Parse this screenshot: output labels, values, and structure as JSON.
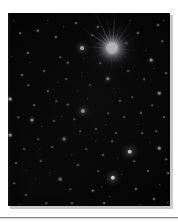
{
  "page": {
    "background_color": "#ffffff",
    "divider_color": "#8a8a8a"
  },
  "figure": {
    "name": "star-field-plate",
    "alt_text": "Dark astronomical star field photograph with one dominant bright star showing diffraction spikes",
    "plate_color": "#030303",
    "star_color": "#ffffff",
    "bounds": {
      "x": 8,
      "y": 13,
      "width": 162,
      "height": 193
    }
  },
  "chart_data": {
    "type": "scatter",
    "title": "",
    "xlabel": "",
    "ylabel": "",
    "xlim": [
      0,
      162
    ],
    "ylim": [
      0,
      193
    ],
    "grid": false,
    "legend": false,
    "primary_star": {
      "label": "dominant bright star",
      "x": 104,
      "y": 35,
      "magnitude": 1.0,
      "spikes": 24,
      "spike_length": 44
    },
    "series": [
      {
        "name": "field stars",
        "points": [
          {
            "x": 104,
            "y": 35,
            "m": 1.0
          },
          {
            "x": 74,
            "y": 35,
            "m": 0.48
          },
          {
            "x": 75,
            "y": 98,
            "m": 0.52
          },
          {
            "x": 122,
            "y": 139,
            "m": 0.58
          },
          {
            "x": 105,
            "y": 165,
            "m": 0.55
          },
          {
            "x": 100,
            "y": 66,
            "m": 0.4
          },
          {
            "x": 143,
            "y": 47,
            "m": 0.3
          },
          {
            "x": 24,
            "y": 107,
            "m": 0.34
          },
          {
            "x": 2,
            "y": 86,
            "m": 0.3
          },
          {
            "x": 2,
            "y": 122,
            "m": 0.28
          },
          {
            "x": 151,
            "y": 80,
            "m": 0.26
          },
          {
            "x": 56,
            "y": 126,
            "m": 0.3
          },
          {
            "x": 151,
            "y": 135,
            "m": 0.26
          },
          {
            "x": 52,
            "y": 166,
            "m": 0.28
          },
          {
            "x": 85,
            "y": 178,
            "m": 0.24
          },
          {
            "x": 30,
            "y": 18,
            "m": 0.22
          },
          {
            "x": 48,
            "y": 24,
            "m": 0.2
          },
          {
            "x": 20,
            "y": 40,
            "m": 0.2
          },
          {
            "x": 60,
            "y": 50,
            "m": 0.22
          },
          {
            "x": 90,
            "y": 14,
            "m": 0.18
          },
          {
            "x": 130,
            "y": 20,
            "m": 0.18
          },
          {
            "x": 150,
            "y": 12,
            "m": 0.17
          },
          {
            "x": 112,
            "y": 88,
            "m": 0.2
          },
          {
            "x": 133,
            "y": 100,
            "m": 0.19
          },
          {
            "x": 60,
            "y": 92,
            "m": 0.22
          },
          {
            "x": 40,
            "y": 78,
            "m": 0.18
          },
          {
            "x": 14,
            "y": 62,
            "m": 0.17
          },
          {
            "x": 33,
            "y": 148,
            "m": 0.2
          },
          {
            "x": 70,
            "y": 152,
            "m": 0.19
          },
          {
            "x": 95,
            "y": 142,
            "m": 0.18
          },
          {
            "x": 128,
            "y": 176,
            "m": 0.18
          },
          {
            "x": 146,
            "y": 186,
            "m": 0.17
          },
          {
            "x": 18,
            "y": 182,
            "m": 0.17
          },
          {
            "x": 64,
            "y": 190,
            "m": 0.16
          },
          {
            "x": 108,
            "y": 120,
            "m": 0.17
          },
          {
            "x": 88,
            "y": 116,
            "m": 0.16
          },
          {
            "x": 46,
            "y": 108,
            "m": 0.16
          },
          {
            "x": 156,
            "y": 104,
            "m": 0.15
          },
          {
            "x": 120,
            "y": 58,
            "m": 0.15
          },
          {
            "x": 82,
            "y": 72,
            "m": 0.15
          },
          {
            "x": 26,
            "y": 92,
            "m": 0.14
          },
          {
            "x": 140,
            "y": 158,
            "m": 0.15
          },
          {
            "x": 96,
            "y": 190,
            "m": 0.14
          },
          {
            "x": 8,
            "y": 150,
            "m": 0.14
          },
          {
            "x": 58,
            "y": 66,
            "m": 0.14
          },
          {
            "x": 116,
            "y": 104,
            "m": 0.13
          },
          {
            "x": 36,
            "y": 58,
            "m": 0.13
          },
          {
            "x": 68,
            "y": 10,
            "m": 0.13
          },
          {
            "x": 158,
            "y": 60,
            "m": 0.13
          },
          {
            "x": 12,
            "y": 20,
            "m": 0.12
          },
          {
            "x": 44,
            "y": 134,
            "m": 0.13
          },
          {
            "x": 78,
            "y": 136,
            "m": 0.12
          },
          {
            "x": 100,
            "y": 100,
            "m": 0.12
          },
          {
            "x": 134,
            "y": 120,
            "m": 0.12
          },
          {
            "x": 160,
            "y": 160,
            "m": 0.12
          },
          {
            "x": 6,
            "y": 170,
            "m": 0.12
          },
          {
            "x": 92,
            "y": 50,
            "m": 0.12
          },
          {
            "x": 52,
            "y": 44,
            "m": 0.11
          },
          {
            "x": 124,
            "y": 84,
            "m": 0.11
          },
          {
            "x": 72,
            "y": 118,
            "m": 0.11
          },
          {
            "x": 30,
            "y": 126,
            "m": 0.11
          },
          {
            "x": 148,
            "y": 118,
            "m": 0.11
          },
          {
            "x": 112,
            "y": 196,
            "m": 0.11
          },
          {
            "x": 38,
            "y": 190,
            "m": 0.1
          },
          {
            "x": 154,
            "y": 28,
            "m": 0.1
          },
          {
            "x": 84,
            "y": 22,
            "m": 0.1
          },
          {
            "x": 16,
            "y": 136,
            "m": 0.1
          },
          {
            "x": 62,
            "y": 176,
            "m": 0.1
          },
          {
            "x": 136,
            "y": 66,
            "m": 0.1
          },
          {
            "x": 104,
            "y": 128,
            "m": 0.1
          },
          {
            "x": 20,
            "y": 72,
            "m": 0.09
          },
          {
            "x": 144,
            "y": 92,
            "m": 0.09
          },
          {
            "x": 66,
            "y": 106,
            "m": 0.09
          },
          {
            "x": 118,
            "y": 30,
            "m": 0.09
          },
          {
            "x": 90,
            "y": 158,
            "m": 0.09
          },
          {
            "x": 48,
            "y": 88,
            "m": 0.09
          },
          {
            "x": 158,
            "y": 146,
            "m": 0.09
          },
          {
            "x": 10,
            "y": 104,
            "m": 0.09
          },
          {
            "x": 126,
            "y": 148,
            "m": 0.09
          },
          {
            "x": 74,
            "y": 60,
            "m": 0.08
          },
          {
            "x": 42,
            "y": 160,
            "m": 0.08
          },
          {
            "x": 106,
            "y": 76,
            "m": 0.08
          },
          {
            "x": 152,
            "y": 172,
            "m": 0.08
          },
          {
            "x": 28,
            "y": 166,
            "m": 0.08
          },
          {
            "x": 80,
            "y": 86,
            "m": 0.08
          },
          {
            "x": 138,
            "y": 38,
            "m": 0.08
          },
          {
            "x": 56,
            "y": 14,
            "m": 0.08
          },
          {
            "x": 98,
            "y": 112,
            "m": 0.08
          },
          {
            "x": 22,
            "y": 50,
            "m": 0.07
          },
          {
            "x": 164,
            "y": 74,
            "m": 0.07
          },
          {
            "x": 114,
            "y": 162,
            "m": 0.07
          },
          {
            "x": 34,
            "y": 114,
            "m": 0.07
          },
          {
            "x": 86,
            "y": 196,
            "m": 0.07
          },
          {
            "x": 146,
            "y": 56,
            "m": 0.07
          },
          {
            "x": 70,
            "y": 78,
            "m": 0.07
          },
          {
            "x": 12,
            "y": 192,
            "m": 0.07
          },
          {
            "x": 130,
            "y": 112,
            "m": 0.07
          },
          {
            "x": 50,
            "y": 70,
            "m": 0.07
          },
          {
            "x": 160,
            "y": 190,
            "m": 0.07
          },
          {
            "x": 94,
            "y": 174,
            "m": 0.07
          },
          {
            "x": 4,
            "y": 44,
            "m": 0.07
          },
          {
            "x": 122,
            "y": 8,
            "m": 0.06
          },
          {
            "x": 64,
            "y": 142,
            "m": 0.06
          },
          {
            "x": 40,
            "y": 8,
            "m": 0.06
          },
          {
            "x": 142,
            "y": 130,
            "m": 0.06
          },
          {
            "x": 102,
            "y": 184,
            "m": 0.06
          },
          {
            "x": 18,
            "y": 158,
            "m": 0.06
          },
          {
            "x": 156,
            "y": 8,
            "m": 0.06
          },
          {
            "x": 76,
            "y": 46,
            "m": 0.06
          },
          {
            "x": 110,
            "y": 146,
            "m": 0.06
          },
          {
            "x": 32,
            "y": 136,
            "m": 0.06
          },
          {
            "x": 88,
            "y": 128,
            "m": 0.06
          },
          {
            "x": 150,
            "y": 200,
            "m": 0.06
          },
          {
            "x": 6,
            "y": 8,
            "m": 0.06
          },
          {
            "x": 54,
            "y": 104,
            "m": 0.06
          },
          {
            "x": 132,
            "y": 192,
            "m": 0.06
          }
        ]
      }
    ]
  }
}
